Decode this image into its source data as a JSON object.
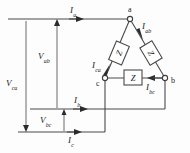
{
  "figure": {
    "line_color": "#4a4a4a",
    "text_color": "#1c1c1c",
    "background": "#fdfdfd"
  },
  "nodes": [
    {
      "id": "a",
      "label": "a",
      "x": 130,
      "y": 19
    },
    {
      "id": "b",
      "label": "b",
      "x": 165,
      "y": 78
    },
    {
      "id": "c",
      "label": "c",
      "x": 105,
      "y": 78
    }
  ],
  "impedances": [
    {
      "id": "z-ac",
      "label": "Z",
      "branch": "a-c",
      "orientation": "diagonal-left"
    },
    {
      "id": "z-ab",
      "label": "Z",
      "branch": "a-b",
      "orientation": "diagonal-right"
    },
    {
      "id": "z-cb",
      "label": "Z",
      "branch": "c-b",
      "orientation": "horizontal"
    }
  ],
  "line_currents": [
    {
      "id": "I-a",
      "base": "I",
      "sub": "a",
      "line": "top",
      "direction": "right"
    },
    {
      "id": "I-b",
      "base": "I",
      "sub": "b",
      "line": "middle",
      "direction": "right"
    },
    {
      "id": "I-c",
      "base": "I",
      "sub": "c",
      "line": "bottom",
      "direction": "right"
    }
  ],
  "branch_currents": [
    {
      "id": "I-ab",
      "base": "I",
      "sub": "ab",
      "branch": "a-b",
      "direction": "from-a-to-b"
    },
    {
      "id": "I-bc",
      "base": "I",
      "sub": "bc",
      "branch": "b-c",
      "direction": "from-b-to-c"
    },
    {
      "id": "I-ca",
      "base": "I",
      "sub": "ca",
      "branch": "c-a",
      "direction": "from-c-to-a"
    }
  ],
  "voltages": [
    {
      "id": "V-ab",
      "base": "V",
      "sub": "ab",
      "direction": "up"
    },
    {
      "id": "V-ca",
      "base": "V",
      "sub": "ca",
      "direction": "down"
    },
    {
      "id": "V-bc",
      "base": "V",
      "sub": "bc",
      "direction": "up"
    }
  ]
}
